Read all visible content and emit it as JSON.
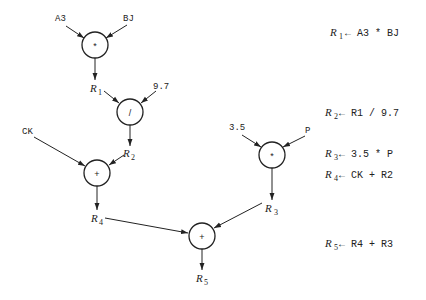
{
  "diagram": {
    "nodes": [
      {
        "id": "n1",
        "op": "*",
        "cx": 95,
        "cy": 45,
        "r": 13
      },
      {
        "id": "n2",
        "op": "/",
        "cx": 130,
        "cy": 112,
        "r": 13
      },
      {
        "id": "n3",
        "op": "+",
        "cx": 97,
        "cy": 173,
        "r": 13
      },
      {
        "id": "n4",
        "op": "*",
        "cx": 272,
        "cy": 155,
        "r": 13
      },
      {
        "id": "n5",
        "op": "+",
        "cx": 202,
        "cy": 236,
        "r": 13
      }
    ],
    "inputs": [
      {
        "id": "A3",
        "text": "A3",
        "x": 62,
        "y": 21
      },
      {
        "id": "BJ",
        "text": "BJ",
        "x": 128,
        "y": 21
      },
      {
        "id": "c97",
        "text": "9.7",
        "x": 157,
        "y": 89
      },
      {
        "id": "CK",
        "text": "CK",
        "x": 28,
        "y": 134
      },
      {
        "id": "c35",
        "text": "3.5",
        "x": 237,
        "y": 130
      },
      {
        "id": "P",
        "text": "P",
        "x": 308,
        "y": 133
      }
    ],
    "registers": [
      {
        "id": "R1",
        "base": "R",
        "sub": "1",
        "x": 92,
        "y": 92
      },
      {
        "id": "R2",
        "base": "R",
        "sub": "2",
        "x": 125,
        "y": 156
      },
      {
        "id": "R3",
        "base": "R",
        "sub": "3",
        "x": 266,
        "y": 212
      },
      {
        "id": "R4",
        "base": "R",
        "sub": "4",
        "x": 91,
        "y": 222
      },
      {
        "id": "R5",
        "base": "R",
        "sub": "5",
        "x": 196,
        "y": 282
      }
    ],
    "equations": [
      {
        "lhs": "R",
        "lhs_sub": "1",
        "rhs": "← A3 * BJ",
        "x": 330,
        "y": 34
      },
      {
        "lhs": "R",
        "lhs_sub": "2",
        "rhs": "← R1 / 9.7",
        "x": 325,
        "y": 113
      },
      {
        "lhs": "R",
        "lhs_sub": "3",
        "rhs": "← 3.5 * P",
        "x": 325,
        "y": 155
      },
      {
        "lhs": "R",
        "lhs_sub": "4",
        "rhs": "← CK + R2",
        "x": 325,
        "y": 176
      },
      {
        "lhs": "R",
        "lhs_sub": "5",
        "rhs": "← R4 + R3",
        "x": 325,
        "y": 245
      }
    ],
    "equation_text": [
      "R1 ← A3 * BJ",
      "R2 ← R1 / 9.7",
      "R3 ← 3.5 * P",
      "R4 ← CK + R2",
      "R5 ← R4 + R3"
    ],
    "colors": {
      "ink": "#222222",
      "background": "#ffffff"
    }
  }
}
